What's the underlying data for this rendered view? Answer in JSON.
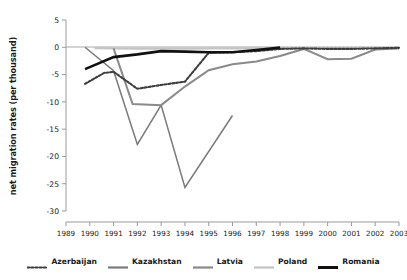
{
  "chart_data": {
    "type": "line",
    "title": "",
    "xlabel": "",
    "ylabel": "net migration rates (per thousand)",
    "x": [
      1989,
      1990,
      1991,
      1992,
      1993,
      1994,
      1995,
      1996,
      1997,
      1998,
      1999,
      2000,
      2001,
      2002,
      2003
    ],
    "xtick_labels": [
      "1989",
      "1990",
      "1991",
      "1992",
      "1993",
      "1994",
      "1995",
      "1996",
      "1997",
      "1998",
      "1999",
      "2000",
      "2001",
      "2002",
      "2003"
    ],
    "xlim": [
      1989,
      2003
    ],
    "ylim": [
      -30,
      5
    ],
    "ytick_labels": [
      "5",
      "0",
      "-5",
      "-10",
      "-15",
      "-20",
      "-25",
      "-30"
    ],
    "yticks": [
      5,
      0,
      -5,
      -10,
      -15,
      -20,
      -25,
      -30
    ],
    "grid": false,
    "legend_position": "bottom",
    "zero_line": true,
    "series": [
      {
        "name": "Azerbaijan",
        "style": "dotted",
        "color": "#3d3d3d",
        "width": 2.1,
        "points": [
          [
            1989.8,
            -6.7
          ],
          [
            1990.6,
            -4.7
          ],
          [
            1991.0,
            -4.5
          ],
          [
            1992.0,
            -7.6
          ],
          [
            1993.0,
            -6.9
          ],
          [
            1994.0,
            -6.3
          ],
          [
            1995.0,
            -1.0
          ],
          [
            1996.0,
            -0.9
          ],
          [
            1997.0,
            -0.7
          ],
          [
            1998.0,
            -0.3
          ],
          [
            1999.0,
            -0.2
          ],
          [
            2000.0,
            -0.3
          ],
          [
            2001.0,
            -0.3
          ],
          [
            2002.0,
            -0.2
          ],
          [
            2003.0,
            -0.1
          ]
        ]
      },
      {
        "name": "Kazakhstan",
        "style": "solid",
        "color": "#7a7a7a",
        "width": 1.5,
        "points": [
          [
            1989.8,
            0.0
          ],
          [
            1991.0,
            -4.3
          ],
          [
            1992.0,
            -17.8
          ],
          [
            1993.0,
            -10.6
          ],
          [
            1994.0,
            -25.7
          ],
          [
            1996.0,
            -12.5
          ]
        ]
      },
      {
        "name": "Latvia",
        "style": "solid",
        "color": "#8a8a8a",
        "width": 2.0,
        "points": [
          [
            1991.0,
            -0.2
          ],
          [
            1991.8,
            -10.4
          ],
          [
            1993.0,
            -10.6
          ],
          [
            1994.0,
            -7.2
          ],
          [
            1995.0,
            -4.2
          ],
          [
            1996.0,
            -3.1
          ],
          [
            1997.0,
            -2.6
          ],
          [
            1998.0,
            -1.6
          ],
          [
            1999.0,
            -0.3
          ],
          [
            2000.0,
            -2.2
          ],
          [
            2001.0,
            -2.1
          ],
          [
            2002.0,
            -0.4
          ],
          [
            2003.0,
            -0.2
          ]
        ]
      },
      {
        "name": "Poland",
        "style": "solid",
        "color": "#c4c4c4",
        "width": 2.4,
        "points": [
          [
            1990.2,
            -0.15
          ],
          [
            1991.0,
            -0.2
          ],
          [
            1992.0,
            -0.25
          ],
          [
            1993.0,
            -0.25
          ],
          [
            1994.0,
            -0.25
          ],
          [
            1995.0,
            -0.2
          ],
          [
            1996.0,
            -0.2
          ],
          [
            1997.0,
            -0.2
          ],
          [
            1998.0,
            -0.2
          ],
          [
            1999.0,
            -0.15
          ],
          [
            2000.0,
            -0.15
          ],
          [
            2001.0,
            -0.15
          ],
          [
            2002.0,
            -0.1
          ],
          [
            2003.0,
            -0.1
          ]
        ]
      },
      {
        "name": "Romania",
        "style": "solid",
        "color": "#111111",
        "width": 2.6,
        "points": [
          [
            1989.8,
            -4.0
          ],
          [
            1991.0,
            -1.8
          ],
          [
            1992.0,
            -1.3
          ],
          [
            1993.0,
            -0.7
          ],
          [
            1994.0,
            -0.8
          ],
          [
            1995.0,
            -0.9
          ],
          [
            1996.0,
            -0.9
          ],
          [
            1997.0,
            -0.5
          ],
          [
            1998.0,
            -0.05
          ]
        ]
      }
    ]
  },
  "legend": {
    "items": [
      {
        "label": "Azerbaijan",
        "color": "#3d3d3d",
        "style": "dotted"
      },
      {
        "label": "Kazakhstan",
        "color": "#7a7a7a",
        "style": "solid"
      },
      {
        "label": "Latvia",
        "color": "#8a8a8a",
        "style": "solid"
      },
      {
        "label": "Poland",
        "color": "#c4c4c4",
        "style": "solid"
      },
      {
        "label": "Romania",
        "color": "#111111",
        "style": "solid"
      }
    ]
  },
  "axes": {
    "axis_color": "#9a9a9a",
    "text_color": "#1a1a1a"
  }
}
